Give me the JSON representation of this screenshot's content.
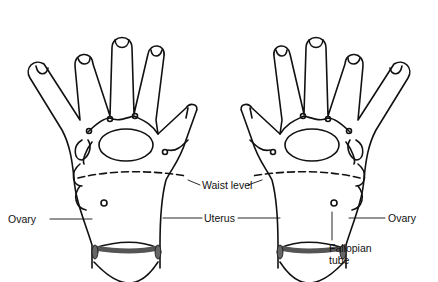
{
  "diagram": {
    "labels": {
      "waist_level": "Waist level",
      "uterus": "Uterus",
      "ovary_left": "Ovary",
      "ovary_right": "Ovary",
      "fallopian_tube_line1": "Fallopian",
      "fallopian_tube_line2": "tube"
    },
    "colors": {
      "ink": "#111111",
      "shading": "#888888",
      "background": "#ffffff"
    }
  }
}
